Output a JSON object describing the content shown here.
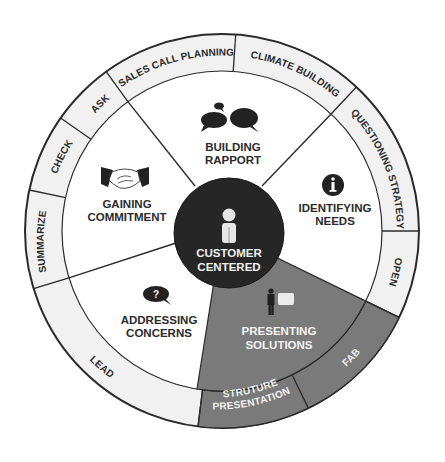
{
  "diagram": {
    "center": {
      "label_line1": "CUSTOMER",
      "label_line2": "CENTERED",
      "icon": "person-icon"
    },
    "sectors": [
      {
        "id": "building-rapport",
        "line1": "BUILDING",
        "line2": "RAPPORT",
        "icon": "speech-bubbles-icon",
        "highlighted": false
      },
      {
        "id": "identifying-needs",
        "line1": "IDENTIFYING",
        "line2": "NEEDS",
        "icon": "info-icon",
        "highlighted": false
      },
      {
        "id": "presenting-solutions",
        "line1": "PRESENTING",
        "line2": "SOLUTIONS",
        "icon": "presenter-icon",
        "highlighted": true
      },
      {
        "id": "addressing-concerns",
        "line1": "ADDRESSING",
        "line2": "CONCERNS",
        "icon": "question-bubble-icon",
        "highlighted": false
      },
      {
        "id": "gaining-commitment",
        "line1": "GAINING",
        "line2": "COMMITMENT",
        "icon": "handshake-icon",
        "highlighted": false
      }
    ],
    "outer_ring": [
      {
        "id": "sales-call-planning",
        "label": "SALES CALL PLANNING",
        "highlighted": false
      },
      {
        "id": "climate-building",
        "label": "CLIMATE BUILDING",
        "highlighted": false
      },
      {
        "id": "questioning-strategy",
        "label": "QUESTIONING STRATEGY",
        "highlighted": false
      },
      {
        "id": "open",
        "label": "OPEN",
        "highlighted": false
      },
      {
        "id": "fab",
        "label": "FAB",
        "highlighted": true
      },
      {
        "id": "presentation-structure",
        "label_line1": "PRESENTATION",
        "label_line2": "STRUTURE",
        "highlighted": true
      },
      {
        "id": "lead",
        "label": "LEAD",
        "highlighted": false
      },
      {
        "id": "summarize",
        "label": "SUMMARIZE",
        "highlighted": false
      },
      {
        "id": "check",
        "label": "CHECK",
        "highlighted": false
      },
      {
        "id": "ask",
        "label": "ASK",
        "highlighted": false
      }
    ],
    "colors": {
      "outline": "#2a2a2a",
      "ring_fill": "#f1f1f1",
      "sector_fill": "#ffffff",
      "highlight_fill": "#777777",
      "center_fill": "#262626",
      "icon_dark": "#222222"
    }
  }
}
